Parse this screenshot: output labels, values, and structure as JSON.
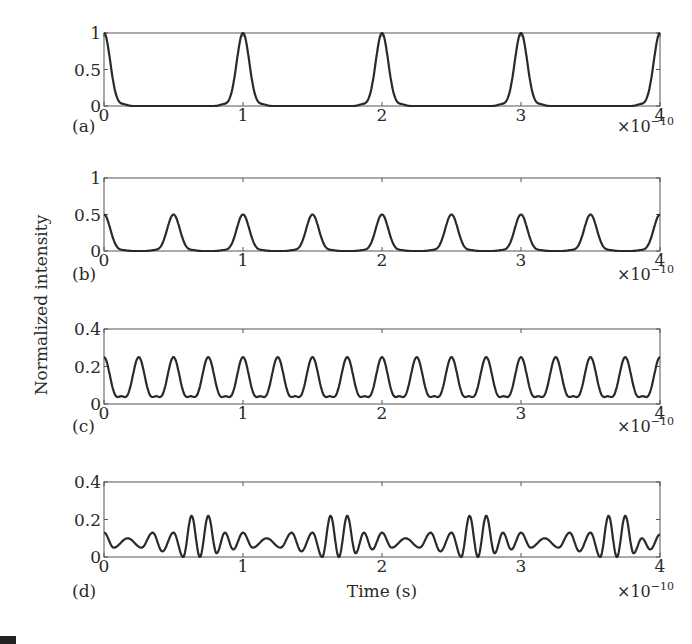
{
  "figure": {
    "ylabel": "Normalized intensity",
    "xlabel": "Time (s)",
    "x_multiplier": "×10",
    "x_multiplier_exp": "−10"
  },
  "chart_data": [
    {
      "type": "line",
      "panel": "(a)",
      "title": "",
      "xlabel": "",
      "ylabel": "Normalized intensity",
      "xlim": [
        0,
        4
      ],
      "x_scale_note": "×10^-10 s",
      "ylim": [
        0,
        1
      ],
      "xticks": [
        "0",
        "1",
        "2",
        "3",
        "4"
      ],
      "yticks": [
        "0",
        "0.5",
        "1"
      ],
      "grid": false,
      "series": [
        {
          "name": "intensity",
          "description": "Pulse train, period 1e-10 s, peak 1.0, narrow Gaussian-like pulses with tiny sidelobes",
          "peak_positions": [
            0,
            1,
            2,
            3,
            4
          ],
          "peak_value": 1.0,
          "baseline": 0.0,
          "sidelobe_value": 0.02
        }
      ]
    },
    {
      "type": "line",
      "panel": "(b)",
      "xlim": [
        0,
        4
      ],
      "x_scale_note": "×10^-10 s",
      "ylim": [
        0,
        1
      ],
      "xticks": [
        "0",
        "1",
        "2",
        "3",
        "4"
      ],
      "yticks": [
        "0",
        "0.5",
        "1"
      ],
      "grid": false,
      "series": [
        {
          "name": "intensity",
          "description": "Pulse train, period 0.5e-10 s, peak 0.5",
          "peak_positions": [
            0,
            0.5,
            1,
            1.5,
            2,
            2.5,
            3,
            3.5,
            4
          ],
          "peak_value": 0.5,
          "baseline": 0.0,
          "sidelobe_value": 0.01
        }
      ]
    },
    {
      "type": "line",
      "panel": "(c)",
      "xlim": [
        0,
        4
      ],
      "x_scale_note": "×10^-10 s",
      "ylim": [
        0,
        0.4
      ],
      "xticks": [
        "0",
        "1",
        "2",
        "3",
        "4"
      ],
      "yticks": [
        "0",
        "0.2",
        "0.4"
      ],
      "grid": false,
      "series": [
        {
          "name": "intensity",
          "description": "Pulse train, period 0.25e-10 s, peak ~0.25, small bumps (~0.02) between pulses",
          "peak_positions": [
            0,
            0.25,
            0.5,
            0.75,
            1,
            1.25,
            1.5,
            1.75,
            2,
            2.25,
            2.5,
            2.75,
            3,
            3.25,
            3.5,
            3.75,
            4
          ],
          "peak_value": 0.25,
          "baseline": 0.0,
          "sidelobe_value": 0.02
        }
      ]
    },
    {
      "type": "line",
      "panel": "(d)",
      "xlim": [
        0,
        4
      ],
      "x_scale_note": "×10^-10 s",
      "ylim": [
        0,
        0.4
      ],
      "xticks": [
        "0",
        "1",
        "2",
        "3",
        "4"
      ],
      "yticks": [
        "0",
        "0.2",
        "0.4"
      ],
      "xlabel": "Time (s)",
      "grid": false,
      "series": [
        {
          "name": "intensity",
          "description": "Irregular oscillation, period-1e-10 pattern, pairs of tall peaks (~0.22) near 0.63,0.75 / 1.63,1.75 / 2.63,2.75 / 3.63,3.75; smaller oscillations 0.04–0.13 elsewhere",
          "x": [
            0,
            0.07,
            0.17,
            0.27,
            0.35,
            0.42,
            0.5,
            0.57,
            0.63,
            0.69,
            0.75,
            0.81,
            0.87,
            0.93,
            1.0,
            1.07,
            1.17,
            1.27,
            1.35,
            1.42,
            1.5,
            1.57,
            1.63,
            1.69,
            1.75,
            1.81,
            1.87,
            1.93,
            2.0,
            2.07,
            2.17,
            2.27,
            2.35,
            2.42,
            2.5,
            2.57,
            2.63,
            2.69,
            2.75,
            2.81,
            2.87,
            2.93,
            3.0,
            3.07,
            3.17,
            3.27,
            3.35,
            3.42,
            3.5,
            3.57,
            3.63,
            3.69,
            3.75,
            3.81,
            3.87,
            3.93,
            4.0
          ],
          "y": [
            0.13,
            0.05,
            0.1,
            0.05,
            0.13,
            0.03,
            0.13,
            0.0,
            0.22,
            0.0,
            0.22,
            0.02,
            0.13,
            0.04,
            0.13,
            0.05,
            0.1,
            0.05,
            0.13,
            0.03,
            0.13,
            0.0,
            0.22,
            0.0,
            0.22,
            0.02,
            0.13,
            0.04,
            0.13,
            0.05,
            0.1,
            0.05,
            0.13,
            0.03,
            0.13,
            0.0,
            0.22,
            0.0,
            0.22,
            0.02,
            0.13,
            0.04,
            0.13,
            0.05,
            0.1,
            0.05,
            0.13,
            0.03,
            0.13,
            0.0,
            0.22,
            0.0,
            0.22,
            0.02,
            0.1,
            0.04,
            0.12
          ]
        }
      ]
    }
  ]
}
